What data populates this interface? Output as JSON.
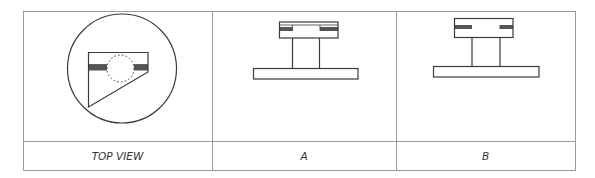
{
  "figure": {
    "columns": [
      {
        "id": "top-view",
        "label": "TOP VIEW"
      },
      {
        "id": "a",
        "label": "A"
      },
      {
        "id": "b",
        "label": "B"
      }
    ]
  },
  "colors": {
    "line": "#3a3a3a",
    "grid": "#9a9a9a",
    "fill_bar": "#555555",
    "background": "#ffffff"
  }
}
